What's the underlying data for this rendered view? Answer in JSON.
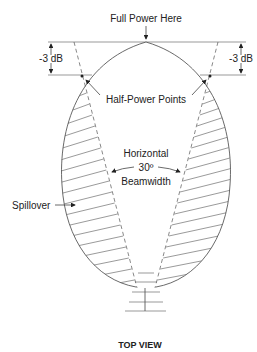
{
  "diagram": {
    "title_label": "TOP VIEW",
    "labels": {
      "full_power": "Full Power Here",
      "minus3db_left": "-3 dB",
      "minus3db_right": "-3 dB",
      "half_power": "Half-Power Points",
      "beam_line1": "Horizontal",
      "beam_line2": "30º",
      "beam_line3": "Beamwidth",
      "spillover": "Spillover"
    },
    "icons": {
      "antenna": "yagi-antenna-icon"
    }
  }
}
